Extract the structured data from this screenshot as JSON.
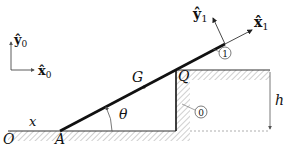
{
  "diagram": {
    "type": "mechanics-free-body",
    "frame0": {
      "x_label": "x̂",
      "x_sub": "0",
      "y_label": "ŷ",
      "y_sub": "0"
    },
    "frame1": {
      "x_label": "x̂",
      "x_sub": "1",
      "y_label": "ŷ",
      "y_sub": "1"
    },
    "points": {
      "origin": "O",
      "contact_ground": "A",
      "center_of_mass": "G",
      "corner": "Q"
    },
    "variables": {
      "position": "x",
      "angle": "θ",
      "height": "h"
    },
    "bodies": {
      "bar": "1",
      "ground": "0"
    }
  }
}
